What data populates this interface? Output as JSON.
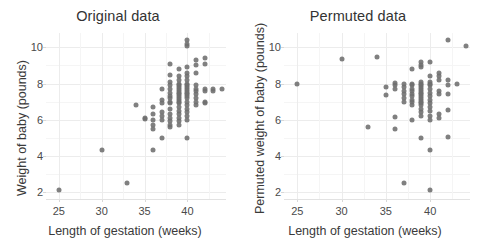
{
  "figure": {
    "width": 481,
    "height": 244,
    "background": "#ffffff",
    "point_color": "#6e6e6e",
    "grid_color": "#ececec",
    "text_color": "#3a3a3a"
  },
  "panels": [
    {
      "title": "Original data",
      "xlabel": "Length of gestation (weeks)",
      "ylabel": "Weight of baby (pounds)"
    },
    {
      "title": "Permuted data",
      "xlabel": "Length of gestation (weeks)",
      "ylabel": "Permuted weight of baby (pounds)"
    }
  ],
  "axes": {
    "x_ticks": [
      25,
      30,
      35,
      40
    ],
    "y_ticks": [
      2,
      4,
      6,
      8,
      10
    ],
    "xlim": [
      23.5,
      44.5
    ],
    "ylim": [
      1.6,
      10.8
    ]
  },
  "chart_data": [
    {
      "type": "scatter",
      "title": "Original data",
      "xlabel": "Length of gestation (weeks)",
      "ylabel": "Weight of baby (pounds)",
      "xlim": [
        23.5,
        44.5
      ],
      "ylim": [
        1.6,
        10.8
      ],
      "xticks": [
        25,
        30,
        35,
        40
      ],
      "yticks": [
        2,
        4,
        6,
        8,
        10
      ],
      "grid": true,
      "legend": "none",
      "marker_color": "#6e6e6e",
      "points": [
        [
          25,
          2.1
        ],
        [
          30,
          4.3
        ],
        [
          33,
          2.5
        ],
        [
          34,
          6.8
        ],
        [
          35,
          6.1
        ],
        [
          35,
          6.05
        ],
        [
          36,
          6.7
        ],
        [
          36,
          6.3
        ],
        [
          36,
          6.0
        ],
        [
          36,
          5.7
        ],
        [
          36,
          5.5
        ],
        [
          36,
          4.3
        ],
        [
          37,
          7.7
        ],
        [
          37,
          7.1
        ],
        [
          37,
          6.9
        ],
        [
          37,
          6.4
        ],
        [
          37,
          6.2
        ],
        [
          37,
          6.0
        ],
        [
          37,
          5.0
        ],
        [
          38,
          9.1
        ],
        [
          38,
          8.5
        ],
        [
          38,
          8.1
        ],
        [
          38,
          7.9
        ],
        [
          38,
          7.7
        ],
        [
          38,
          7.5
        ],
        [
          38,
          7.3
        ],
        [
          38,
          7.2
        ],
        [
          38,
          7.0
        ],
        [
          38,
          6.9
        ],
        [
          38,
          6.6
        ],
        [
          38,
          6.3
        ],
        [
          38,
          6.1
        ],
        [
          38,
          5.9
        ],
        [
          38,
          5.7
        ],
        [
          38,
          5.6
        ],
        [
          39,
          8.8
        ],
        [
          39,
          8.4
        ],
        [
          39,
          8.2
        ],
        [
          39,
          8.0
        ],
        [
          39,
          7.9
        ],
        [
          39,
          7.8
        ],
        [
          39,
          7.7
        ],
        [
          39,
          7.6
        ],
        [
          39,
          7.5
        ],
        [
          39,
          7.4
        ],
        [
          39,
          7.3
        ],
        [
          39,
          7.2
        ],
        [
          39,
          7.1
        ],
        [
          39,
          7.0
        ],
        [
          39,
          6.9
        ],
        [
          39,
          6.7
        ],
        [
          39,
          6.5
        ],
        [
          39,
          6.3
        ],
        [
          39,
          6.1
        ],
        [
          39,
          5.9
        ],
        [
          39,
          5.7
        ],
        [
          40,
          10.4
        ],
        [
          40,
          10.2
        ],
        [
          40,
          10.1
        ],
        [
          40,
          8.9
        ],
        [
          40,
          8.6
        ],
        [
          40,
          8.4
        ],
        [
          40,
          8.2
        ],
        [
          40,
          8.0
        ],
        [
          40,
          7.9
        ],
        [
          40,
          7.8
        ],
        [
          40,
          7.7
        ],
        [
          40,
          7.6
        ],
        [
          40,
          7.5
        ],
        [
          40,
          7.4
        ],
        [
          40,
          7.3
        ],
        [
          40,
          7.2
        ],
        [
          40,
          7.0
        ],
        [
          40,
          6.8
        ],
        [
          40,
          6.6
        ],
        [
          40,
          6.4
        ],
        [
          40,
          6.2
        ],
        [
          40,
          6.0
        ],
        [
          40,
          5.0
        ],
        [
          41,
          9.3
        ],
        [
          41,
          9.0
        ],
        [
          41,
          8.6
        ],
        [
          41,
          7.9
        ],
        [
          41,
          7.7
        ],
        [
          41,
          7.6
        ],
        [
          41,
          7.4
        ],
        [
          41,
          7.2
        ],
        [
          41,
          7.0
        ],
        [
          41,
          6.8
        ],
        [
          42,
          9.4
        ],
        [
          42,
          9.1
        ],
        [
          42,
          7.7
        ],
        [
          42,
          7.6
        ],
        [
          42,
          7.0
        ],
        [
          42,
          6.9
        ],
        [
          43,
          7.7
        ],
        [
          43,
          7.6
        ],
        [
          44,
          7.7
        ]
      ]
    },
    {
      "type": "scatter",
      "title": "Permuted data",
      "xlabel": "Length of gestation (weeks)",
      "ylabel": "Permuted weight of baby (pounds)",
      "xlim": [
        23.5,
        44.5
      ],
      "ylim": [
        1.6,
        10.8
      ],
      "xticks": [
        25,
        30,
        35,
        40
      ],
      "yticks": [
        2,
        4,
        6,
        8,
        10
      ],
      "grid": true,
      "legend": "none",
      "marker_color": "#6e6e6e",
      "points": [
        [
          25,
          7.95
        ],
        [
          30,
          9.35
        ],
        [
          33,
          5.6
        ],
        [
          34,
          9.45
        ],
        [
          35,
          7.8
        ],
        [
          35,
          7.35
        ],
        [
          36,
          8.05
        ],
        [
          36,
          7.9
        ],
        [
          36,
          7.7
        ],
        [
          36,
          6.15
        ],
        [
          36,
          5.5
        ],
        [
          37,
          8.0
        ],
        [
          37,
          7.8
        ],
        [
          37,
          7.6
        ],
        [
          37,
          7.4
        ],
        [
          37,
          7.2
        ],
        [
          37,
          7.0
        ],
        [
          37,
          2.5
        ],
        [
          38,
          8.8
        ],
        [
          38,
          8.0
        ],
        [
          38,
          7.9
        ],
        [
          38,
          7.7
        ],
        [
          38,
          7.6
        ],
        [
          38,
          7.4
        ],
        [
          38,
          7.3
        ],
        [
          38,
          7.1
        ],
        [
          38,
          7.0
        ],
        [
          38,
          6.8
        ],
        [
          38,
          6.0
        ],
        [
          39,
          9.2
        ],
        [
          39,
          9.0
        ],
        [
          39,
          8.9
        ],
        [
          39,
          8.1
        ],
        [
          39,
          8.0
        ],
        [
          39,
          7.9
        ],
        [
          39,
          7.8
        ],
        [
          39,
          7.7
        ],
        [
          39,
          7.6
        ],
        [
          39,
          7.5
        ],
        [
          39,
          7.4
        ],
        [
          39,
          7.3
        ],
        [
          39,
          7.2
        ],
        [
          39,
          7.1
        ],
        [
          39,
          7.0
        ],
        [
          39,
          6.9
        ],
        [
          39,
          6.8
        ],
        [
          39,
          6.6
        ],
        [
          39,
          6.4
        ],
        [
          39,
          6.2
        ],
        [
          39,
          5.0
        ],
        [
          40,
          9.2
        ],
        [
          40,
          8.4
        ],
        [
          40,
          8.1
        ],
        [
          40,
          8.0
        ],
        [
          40,
          7.9
        ],
        [
          40,
          7.7
        ],
        [
          40,
          7.5
        ],
        [
          40,
          7.3
        ],
        [
          40,
          7.1
        ],
        [
          40,
          6.9
        ],
        [
          40,
          6.7
        ],
        [
          40,
          6.5
        ],
        [
          40,
          6.2
        ],
        [
          40,
          6.0
        ],
        [
          40,
          4.3
        ],
        [
          40,
          2.1
        ],
        [
          41,
          8.6
        ],
        [
          41,
          8.4
        ],
        [
          41,
          8.2
        ],
        [
          41,
          7.6
        ],
        [
          41,
          7.4
        ],
        [
          41,
          6.3
        ],
        [
          41,
          6.1
        ],
        [
          42,
          10.4
        ],
        [
          42,
          8.2
        ],
        [
          42,
          7.9
        ],
        [
          42,
          7.4
        ],
        [
          42,
          6.55
        ],
        [
          42,
          5.05
        ],
        [
          43,
          8.0
        ],
        [
          44,
          10.1
        ]
      ]
    }
  ]
}
